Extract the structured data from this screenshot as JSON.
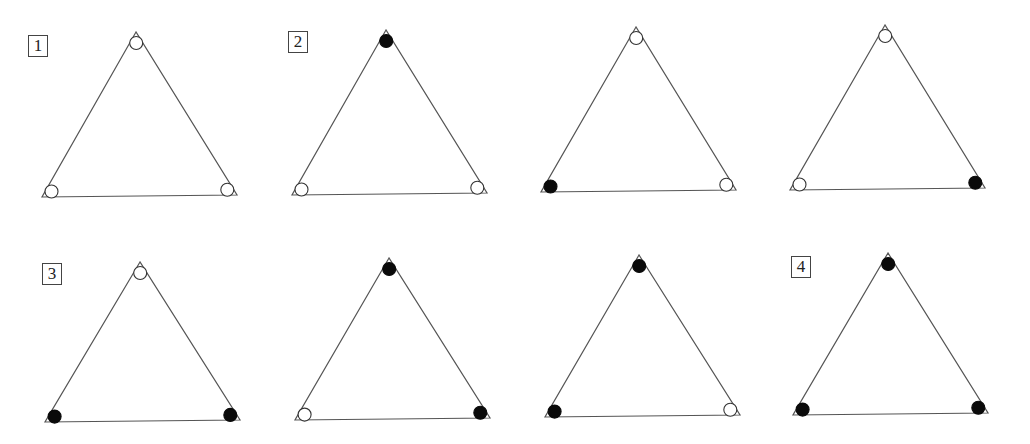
{
  "figure": {
    "marker_legend": {
      "open": "white circle",
      "filled": "black dot"
    },
    "colors": {
      "line": "#555555",
      "filled": "#0a0a0a",
      "open_fill": "#ffffff",
      "background": "#ffffff"
    },
    "labels": [
      {
        "text": "1",
        "x": 28,
        "y": 35
      },
      {
        "text": "2",
        "x": 288,
        "y": 31
      },
      {
        "text": "3",
        "x": 42,
        "y": 263
      },
      {
        "text": "4",
        "x": 791,
        "y": 256
      }
    ],
    "triangles": [
      {
        "row": 1,
        "col": 1,
        "apex": [
          136,
          32
        ],
        "bl": [
          42,
          197
        ],
        "br": [
          237,
          195
        ],
        "markers": {
          "top": "open",
          "bottom_left": "open",
          "bottom_right": "open"
        }
      },
      {
        "row": 1,
        "col": 2,
        "apex": [
          386,
          30
        ],
        "bl": [
          292,
          195
        ],
        "br": [
          487,
          193
        ],
        "markers": {
          "top": "filled",
          "bottom_left": "open",
          "bottom_right": "open"
        }
      },
      {
        "row": 1,
        "col": 3,
        "apex": [
          636,
          27
        ],
        "bl": [
          541,
          192
        ],
        "br": [
          736,
          190
        ],
        "markers": {
          "top": "open",
          "bottom_left": "filled",
          "bottom_right": "open"
        }
      },
      {
        "row": 1,
        "col": 4,
        "apex": [
          885,
          25
        ],
        "bl": [
          790,
          190
        ],
        "br": [
          985,
          188
        ],
        "markers": {
          "top": "open",
          "bottom_left": "open",
          "bottom_right": "filled"
        }
      },
      {
        "row": 2,
        "col": 1,
        "apex": [
          140,
          262
        ],
        "bl": [
          45,
          422
        ],
        "br": [
          240,
          420
        ],
        "markers": {
          "top": "open",
          "bottom_left": "filled",
          "bottom_right": "filled"
        }
      },
      {
        "row": 2,
        "col": 2,
        "apex": [
          389,
          258
        ],
        "bl": [
          295,
          420
        ],
        "br": [
          490,
          418
        ],
        "markers": {
          "top": "filled",
          "bottom_left": "open",
          "bottom_right": "filled"
        }
      },
      {
        "row": 2,
        "col": 3,
        "apex": [
          639,
          255
        ],
        "bl": [
          545,
          417
        ],
        "br": [
          740,
          415
        ],
        "markers": {
          "top": "filled",
          "bottom_left": "filled",
          "bottom_right": "open"
        }
      },
      {
        "row": 2,
        "col": 4,
        "apex": [
          888,
          253
        ],
        "bl": [
          793,
          415
        ],
        "br": [
          988,
          413
        ],
        "markers": {
          "top": "filled",
          "bottom_left": "filled",
          "bottom_right": "filled"
        }
      }
    ]
  }
}
